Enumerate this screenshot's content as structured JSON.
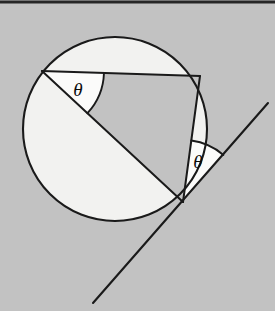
{
  "figure": {
    "kind": "geometry-diagram",
    "concept": "tangent-chord-angle-equals-inscribed-angle",
    "width": 275,
    "height": 311,
    "background_color": "#c2c2c2",
    "top_border_color": "#262626",
    "stroke_color": "#1a1a1a"
  },
  "colors": {
    "background": "#c2c2c2",
    "circle_fill": "#f2f2f0",
    "inner_region_fill": "#c2c2c2",
    "angle_wedge_fill": "#fbfbfa",
    "stroke": "#1a1a1a",
    "border": "#262626",
    "label_text": "#0a0a0a"
  },
  "circle": {
    "label": "circle",
    "cx": 115,
    "cy": 129,
    "r": 92,
    "stroke_width": 2.1
  },
  "points": {
    "chord_left": {
      "name": "A",
      "x": 42,
      "y": 71
    },
    "chord_top_right": {
      "name": "B",
      "x": 200,
      "y": 76
    },
    "tangent_point": {
      "name": "P",
      "x": 183,
      "y": 202
    },
    "diameter_end_left": {
      "name": "A",
      "x": 42,
      "y": 71
    }
  },
  "segments": [
    {
      "name": "chord-top",
      "from": "chord_left",
      "to": "chord_top_right",
      "x1": 42,
      "y1": 71,
      "x2": 200,
      "y2": 76
    },
    {
      "name": "chord-right",
      "from": "chord_top_right",
      "to": "tangent_point",
      "x1": 200,
      "y1": 76,
      "x2": 183,
      "y2": 202
    },
    {
      "name": "chord-diagonal",
      "from": "chord_left",
      "to": "tangent_point",
      "x1": 42,
      "y1": 71,
      "x2": 183,
      "y2": 202
    }
  ],
  "tangent_line": {
    "name": "tangent-line",
    "x1": 268,
    "y1": 103,
    "x2": 93,
    "y2": 303,
    "stroke_width": 2.1
  },
  "angles": [
    {
      "id": "inscribed-angle",
      "label": "θ",
      "vertex": {
        "x": 42,
        "y": 71
      },
      "toward_a": {
        "x": 200,
        "y": 76
      },
      "toward_b": {
        "x": 183,
        "y": 202
      },
      "radius": 62,
      "label_x": 78,
      "label_y": 89
    },
    {
      "id": "tangent-chord-angle",
      "label": "θ",
      "vertex": {
        "x": 183,
        "y": 202
      },
      "toward_a": {
        "x": 200,
        "y": 76
      },
      "toward_b": {
        "x": 268,
        "y": 103
      },
      "radius": 62,
      "label_x": 198,
      "label_y": 161
    }
  ],
  "labels": {
    "theta_inscribed": "θ",
    "theta_tangent": "θ"
  }
}
